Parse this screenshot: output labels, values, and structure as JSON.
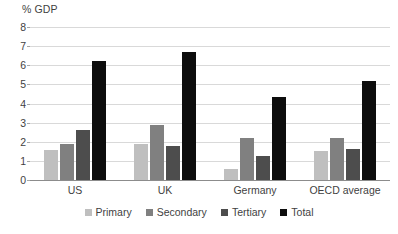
{
  "chart_data": {
    "type": "bar",
    "title": "",
    "subtitle": "",
    "xlabel": "",
    "ylabel": "% GDP",
    "ylim": [
      0,
      8
    ],
    "ytick_step": 1,
    "yticks": [
      "8",
      "7",
      "6",
      "5",
      "4",
      "3",
      "2",
      "1",
      "0"
    ],
    "grid": "horizontal",
    "legend_position": "bottom-center",
    "categories": [
      "US",
      "UK",
      "Germany",
      "OECD average"
    ],
    "series": [
      {
        "name": "Primary",
        "color": "#bfbfbf",
        "values": [
          1.55,
          1.9,
          0.55,
          1.5
        ]
      },
      {
        "name": "Secondary",
        "color": "#808080",
        "values": [
          1.9,
          2.9,
          2.2,
          2.2
        ]
      },
      {
        "name": "Tertiary",
        "color": "#4d4d4d",
        "values": [
          2.6,
          1.8,
          1.25,
          1.6
        ]
      },
      {
        "name": "Total",
        "color": "#0d0d0d",
        "values": [
          6.2,
          6.7,
          4.35,
          5.2
        ]
      }
    ]
  },
  "axis": {
    "y_title": "% GDP"
  },
  "colors": {
    "gridline": "#d9d9d9",
    "baseline": "#8c8c8c",
    "text": "#3f3f3f",
    "background": "#ffffff"
  }
}
